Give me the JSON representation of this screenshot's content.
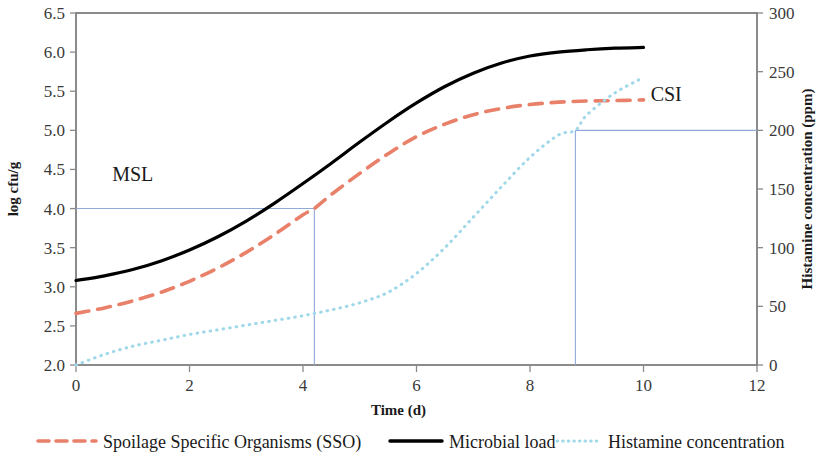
{
  "chart_data": {
    "type": "line",
    "title": "",
    "xlabel": "Time (d)",
    "ylabel": "log cfu/g",
    "y2label": "Histamine concentration (ppm)",
    "xlim": [
      0,
      12
    ],
    "ylim": [
      2.0,
      6.5
    ],
    "y2lim": [
      0,
      300
    ],
    "grid": false,
    "legend_position": "bottom",
    "xticks": [
      "0",
      "2",
      "4",
      "6",
      "8",
      "10",
      "12"
    ],
    "xtick_values": [
      0,
      2,
      4,
      6,
      8,
      10,
      12
    ],
    "yticks": [
      "2.0",
      "2.5",
      "3.0",
      "3.5",
      "4.0",
      "4.5",
      "5.0",
      "5.5",
      "6.0",
      "6.5"
    ],
    "ytick_values": [
      2.0,
      2.5,
      3.0,
      3.5,
      4.0,
      4.5,
      5.0,
      5.5,
      6.0,
      6.5
    ],
    "y2ticks": [
      "0",
      "50",
      "100",
      "150",
      "200",
      "250",
      "300"
    ],
    "y2tick_values": [
      0,
      50,
      100,
      150,
      200,
      250,
      300
    ],
    "series": [
      {
        "name": "Spoilage Specific Organisms (SSO)",
        "axis": "left",
        "style": "dashed",
        "color": "#E8806A",
        "x": [
          0,
          0.5,
          1,
          1.5,
          2,
          2.5,
          3,
          3.5,
          4,
          4.2,
          4.5,
          5,
          5.5,
          6,
          6.5,
          7,
          7.5,
          8,
          8.5,
          9,
          9.5,
          10
        ],
        "values": [
          2.66,
          2.73,
          2.82,
          2.93,
          3.07,
          3.24,
          3.44,
          3.67,
          3.92,
          4.0,
          4.18,
          4.45,
          4.7,
          4.92,
          5.08,
          5.2,
          5.28,
          5.33,
          5.36,
          5.375,
          5.38,
          5.39
        ]
      },
      {
        "name": "Microbial load",
        "axis": "left",
        "style": "solid",
        "color": "#000000",
        "x": [
          0,
          0.5,
          1,
          1.5,
          2,
          2.5,
          3,
          3.5,
          4,
          4.5,
          5,
          5.5,
          6,
          6.5,
          7,
          7.5,
          8,
          8.5,
          9,
          9.5,
          10
        ],
        "values": [
          3.08,
          3.14,
          3.22,
          3.33,
          3.47,
          3.64,
          3.84,
          4.07,
          4.32,
          4.58,
          4.85,
          5.11,
          5.35,
          5.56,
          5.73,
          5.86,
          5.95,
          6.0,
          6.03,
          6.05,
          6.06
        ]
      },
      {
        "name": "Histamine concentration",
        "axis": "right",
        "style": "dotted",
        "color": "#9FD8E8",
        "x": [
          0,
          0.5,
          1,
          1.5,
          2,
          2.5,
          3,
          3.5,
          4,
          4.5,
          5,
          5.5,
          6,
          6.5,
          7,
          7.5,
          8,
          8.5,
          8.8,
          9,
          9.5,
          10
        ],
        "values": [
          0,
          9,
          16,
          21,
          26,
          30,
          34,
          38,
          42,
          47,
          53,
          62,
          78,
          100,
          126,
          152,
          177,
          196,
          200,
          213,
          232,
          245
        ]
      }
    ],
    "annotations": [
      {
        "label": "MSL",
        "color": "#8FA9D8",
        "kind": "threshold-bracket",
        "y_left": 4.0,
        "x_drop": 4.2,
        "label_x": 1.0,
        "label_y": 4.35
      },
      {
        "label": "CSI",
        "color": "#8FA9D8",
        "kind": "threshold-bracket",
        "y_right": 200,
        "x_drop": 8.8,
        "label_x": 10.4,
        "label_y_right": 225
      }
    ]
  },
  "legend": {
    "items": [
      {
        "label": "Spoilage Specific Organisms (SSO)",
        "style": "dashed",
        "color": "#E8806A"
      },
      {
        "label": "Microbial load",
        "style": "solid",
        "color": "#000000"
      },
      {
        "label": "Histamine concentration",
        "style": "dotted",
        "color": "#9FD8E8"
      }
    ]
  }
}
